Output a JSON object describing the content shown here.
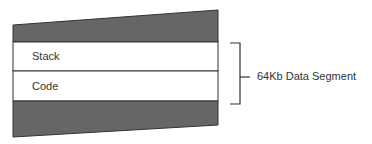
{
  "diagram": {
    "segments": [
      {
        "id": "top-region",
        "label": "",
        "fill": "#666666"
      },
      {
        "id": "stack",
        "label": "Stack",
        "fill": "#ffffff"
      },
      {
        "id": "code",
        "label": "Code",
        "fill": "#ffffff"
      },
      {
        "id": "bottom-region",
        "label": "",
        "fill": "#666666"
      }
    ],
    "bracket_label": "64Kb Data Segment",
    "colors": {
      "dark_fill": "#666666",
      "stroke": "#333333",
      "text": "#333333"
    }
  }
}
